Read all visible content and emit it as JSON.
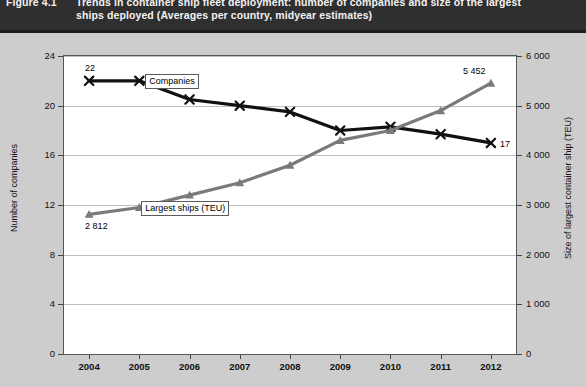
{
  "figure": {
    "number": "Figure 4.1",
    "title_line1": "Trends in container ship fleet deployment: number of companies and size of the largest",
    "title_line2": "ships deployed (Averages per country, midyear estimates)"
  },
  "axes": {
    "left_title": "Number of companies",
    "right_title": "Size of largest container ship (TEU)",
    "left_ticks": [
      "0",
      "4",
      "8",
      "12",
      "16",
      "20",
      "24"
    ],
    "right_ticks": [
      "0",
      "1 000",
      "2 000",
      "3 000",
      "4 000",
      "5 000",
      "6 000"
    ],
    "x_ticks": [
      "2004",
      "2005",
      "2006",
      "2007",
      "2008",
      "2009",
      "2010",
      "2011",
      "2012"
    ]
  },
  "labels": {
    "companies_series": "Companies",
    "teu_series": "Largest ships (TEU)",
    "companies_start": "22",
    "companies_end": "17",
    "teu_start": "2 812",
    "teu_end": "5 452"
  },
  "colors": {
    "banner": "#2f2f2f",
    "figure_background": "#cdcdcd",
    "plot_background": "#ffffff",
    "companies_line": "#111111",
    "teu_line": "#7a7a7a",
    "gridline": "#bfbfbf"
  },
  "chart_data": {
    "type": "line",
    "title": "Trends in container ship fleet deployment: number of companies and size of the largest ships deployed (Averages per country, midyear estimates)",
    "xlabel": "",
    "x": [
      "2004",
      "2005",
      "2006",
      "2007",
      "2008",
      "2009",
      "2010",
      "2011",
      "2012"
    ],
    "grid": true,
    "legend": "inline-labels",
    "series": [
      {
        "name": "Companies",
        "axis": "left",
        "ylabel": "Number of companies",
        "ylim": [
          0,
          24
        ],
        "color": "#111111",
        "marker": "x",
        "values": [
          22,
          22,
          20.5,
          20,
          19.5,
          18,
          18.3,
          17.7,
          17
        ],
        "point_labels": {
          "2004": "22",
          "2012": "17"
        }
      },
      {
        "name": "Largest ships (TEU)",
        "axis": "right",
        "ylabel": "Size of largest container ship (TEU)",
        "ylim": [
          0,
          6000
        ],
        "color": "#7a7a7a",
        "marker": "triangle",
        "values": [
          2812,
          2950,
          3200,
          3450,
          3800,
          4300,
          4500,
          4900,
          5452
        ],
        "point_labels": {
          "2004": "2 812",
          "2012": "5 452"
        }
      }
    ]
  }
}
